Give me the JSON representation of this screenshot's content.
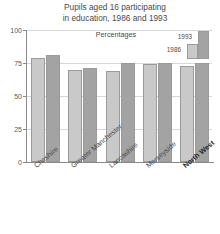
{
  "chart_data": {
    "type": "bar",
    "title": "Pupils aged 16 participating in education, 1986 and 1993",
    "title_line_1": "Pupils aged 16 participating",
    "title_line_2": "in education, 1986 and 1993",
    "subtitle": "Percentages",
    "xlabel": "",
    "ylabel": "",
    "ylim": [
      0,
      100
    ],
    "yticks": [
      100,
      75,
      50,
      25,
      0
    ],
    "ytick_labels": [
      "100",
      "75",
      "50",
      "25",
      "0"
    ],
    "grid": true,
    "legend_position": "top-right",
    "categories": [
      "Cheshire",
      "Greater Manchester",
      "Lancashire",
      "Merseyside",
      "North West"
    ],
    "category_emphasis": [
      false,
      false,
      false,
      false,
      true
    ],
    "series": [
      {
        "name": "1986",
        "color": "#c9c9c9",
        "values": [
          79,
          70,
          69,
          74,
          73
        ]
      },
      {
        "name": "1993",
        "color": "#a3a3a3",
        "values": [
          81,
          71,
          75,
          75,
          75
        ]
      }
    ]
  },
  "colors": {
    "series_1986": "#c9c9c9",
    "series_1993": "#a3a3a3",
    "axis": "#8a8a8a",
    "grid": "#d8d8d8",
    "text": "#4a4a4a",
    "background": "#ffffff"
  }
}
